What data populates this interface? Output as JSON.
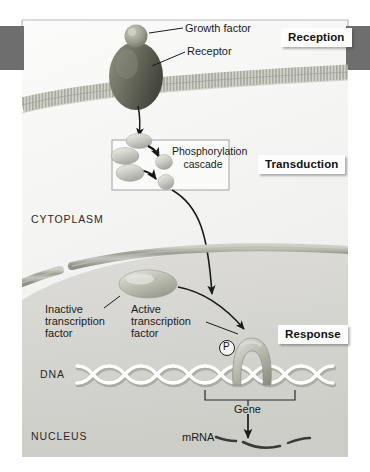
{
  "figure": {
    "background_color": "#ffffff",
    "width": 370,
    "height": 472
  },
  "edge_tabs": {
    "color": "#6e6e6e",
    "left_label": "left-edge-tab",
    "right_label": "right-edge-tab"
  },
  "stages": [
    {
      "id": "reception",
      "label": "Reception"
    },
    {
      "id": "transduction",
      "label": "Transduction"
    },
    {
      "id": "response",
      "label": "Response"
    }
  ],
  "annotations": {
    "growth_factor": "Growth factor",
    "receptor": "Receptor",
    "phosphorylation_cascade_line1": "Phosphorylation",
    "phosphorylation_cascade_line2": "cascade",
    "cytoplasm": "CYTOPLASM",
    "inactive_tf_line1": "Inactive",
    "inactive_tf_line2": "transcription",
    "inactive_tf_line3": "factor",
    "active_tf_line1": "Active",
    "active_tf_line2": "transcription",
    "active_tf_line3": "factor",
    "phosphate": "P",
    "dna": "DNA",
    "gene": "Gene",
    "nucleus": "NUCLEUS",
    "mrna": "mRNA"
  },
  "colors": {
    "receptor_fill": "#6d6f62",
    "receptor_dark": "#4a4c42",
    "growth_factor_fill": "#9a9c8e",
    "relay_fill": "#c9cac2",
    "relay_light": "#e4e5e0",
    "membrane": "#b8bab0",
    "nuclear_envelope": "#a9aba2",
    "cytoplasm_bg": "#f2f2f0",
    "nucleus_bg": "#d9d9d5",
    "dna_strand": "#ffffff",
    "dna_shadow": "#8f9189",
    "arrow": "#1a1a1a",
    "tf_fill": "#b5b7ac",
    "mrna": "#3a3a38"
  },
  "elements": {
    "plasma_membrane": "plasma-membrane",
    "nuclear_envelope": "nuclear-envelope",
    "receptor": "receptor-protein",
    "growth_factor": "growth-factor-ligand",
    "relay_molecules": "relay-molecule",
    "inactive_tf": "inactive-transcription-factor",
    "active_tf": "active-transcription-factor",
    "dna_helix": "dna-double-helix",
    "gene_bracket": "gene-bracket",
    "mrna_strand": "mrna-strand"
  }
}
